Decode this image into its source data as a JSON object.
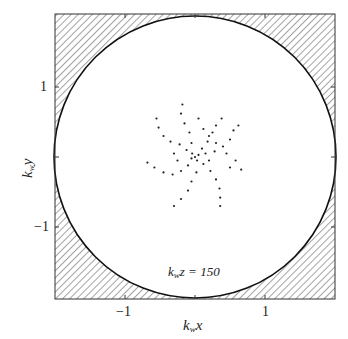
{
  "figure": {
    "annotation_prefix": "k",
    "annotation_sub": "w",
    "annotation_suffix": "z = 150",
    "xlabel_prefix": "k",
    "xlabel_sub": "w",
    "xlabel_suffix": "x",
    "ylabel_prefix": "k",
    "ylabel_sub": "w",
    "ylabel_suffix": "y",
    "xticks": [
      "−1",
      "1"
    ],
    "yticks": [
      "1",
      "−1"
    ]
  },
  "chart_data": {
    "type": "scatter",
    "title": "",
    "annotation": "k_w z = 150",
    "xlabel": "k_w x",
    "ylabel": "k_w y",
    "xlim": [
      -2,
      2
    ],
    "ylim": [
      -2,
      2
    ],
    "xticks": [
      -1,
      1
    ],
    "yticks": [
      -1,
      1
    ],
    "grid": false,
    "boundary": {
      "shape": "circle",
      "radius": 2,
      "outside": "hatched"
    },
    "points": [
      [
        0.0,
        0.0
      ],
      [
        0.05,
        0.03
      ],
      [
        -0.04,
        0.05
      ],
      [
        0.03,
        -0.05
      ],
      [
        -0.05,
        -0.02
      ],
      [
        0.1,
        0.12
      ],
      [
        0.18,
        0.22
      ],
      [
        0.25,
        0.35
      ],
      [
        0.3,
        0.45
      ],
      [
        0.38,
        0.55
      ],
      [
        -0.12,
        0.1
      ],
      [
        -0.22,
        0.18
      ],
      [
        -0.35,
        0.22
      ],
      [
        -0.45,
        0.3
      ],
      [
        -0.52,
        0.42
      ],
      [
        -0.55,
        0.55
      ],
      [
        -0.1,
        -0.12
      ],
      [
        -0.2,
        -0.2
      ],
      [
        -0.32,
        -0.25
      ],
      [
        -0.45,
        -0.22
      ],
      [
        -0.58,
        -0.15
      ],
      [
        -0.68,
        -0.08
      ],
      [
        0.12,
        -0.1
      ],
      [
        0.22,
        -0.2
      ],
      [
        0.3,
        -0.32
      ],
      [
        0.35,
        -0.45
      ],
      [
        0.36,
        -0.58
      ],
      [
        0.36,
        -0.7
      ],
      [
        0.15,
        0.05
      ],
      [
        0.28,
        0.08
      ],
      [
        0.4,
        0.15
      ],
      [
        0.5,
        0.25
      ],
      [
        0.55,
        0.38
      ],
      [
        0.62,
        0.45
      ],
      [
        -0.05,
        0.2
      ],
      [
        -0.08,
        0.35
      ],
      [
        -0.15,
        0.48
      ],
      [
        -0.2,
        0.62
      ],
      [
        -0.18,
        0.75
      ],
      [
        0.02,
        -0.22
      ],
      [
        -0.05,
        -0.35
      ],
      [
        -0.1,
        -0.48
      ],
      [
        -0.2,
        -0.6
      ],
      [
        -0.3,
        -0.7
      ],
      [
        0.2,
        0.3
      ],
      [
        0.12,
        0.4
      ],
      [
        0.05,
        0.55
      ],
      [
        0.3,
        0.2
      ],
      [
        0.45,
        0.05
      ],
      [
        0.58,
        -0.05
      ],
      [
        0.66,
        -0.18
      ],
      [
        0.5,
        -0.15
      ],
      [
        -0.3,
        0.05
      ],
      [
        -0.25,
        -0.05
      ],
      [
        0.2,
        -0.05
      ]
    ]
  }
}
